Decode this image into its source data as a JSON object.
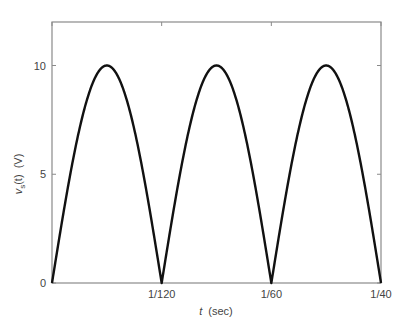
{
  "chart_data": {
    "type": "line",
    "title": "",
    "xlabel": "t (sec)",
    "xlabel_var": "t",
    "xlabel_unit": "(sec)",
    "ylabel": "v_s(t) (V)",
    "ylabel_var": "v",
    "ylabel_sub": "s",
    "ylabel_arg": "(t)",
    "ylabel_unit": "(V)",
    "xlim": [
      0,
      0.025
    ],
    "ylim": [
      0,
      12
    ],
    "grid": false,
    "legend": null,
    "x_ticks": [
      {
        "value": 0,
        "label": ""
      },
      {
        "value": 0.008333,
        "label": "1/120"
      },
      {
        "value": 0.016667,
        "label": "1/60"
      },
      {
        "value": 0.025,
        "label": "1/40"
      }
    ],
    "y_ticks": [
      {
        "value": 0,
        "label": "0"
      },
      {
        "value": 5,
        "label": "5"
      },
      {
        "value": 10,
        "label": "10"
      }
    ],
    "series": [
      {
        "name": "v_s(t)",
        "description": "Full-wave rectified sine, |10 sin(2*pi*60*t)|",
        "amplitude": 10,
        "frequency_hz": 60,
        "color": "#111111",
        "x": [
          0,
          0.001042,
          0.002083,
          0.003125,
          0.004167,
          0.005208,
          0.00625,
          0.007292,
          0.008333,
          0.009375,
          0.010417,
          0.011458,
          0.0125,
          0.013542,
          0.014583,
          0.015625,
          0.016667,
          0.017708,
          0.01875,
          0.019792,
          0.020833,
          0.021875,
          0.022917,
          0.023958,
          0.025
        ],
        "values": [
          0,
          3.83,
          7.07,
          9.24,
          10,
          9.24,
          7.07,
          3.83,
          0,
          3.83,
          7.07,
          9.24,
          10,
          9.24,
          7.07,
          3.83,
          0,
          3.83,
          7.07,
          9.24,
          10,
          9.24,
          7.07,
          3.83,
          0
        ]
      }
    ]
  },
  "colors": {
    "axis": "#8a8a8a",
    "line": "#111111",
    "background": "#ffffff"
  }
}
